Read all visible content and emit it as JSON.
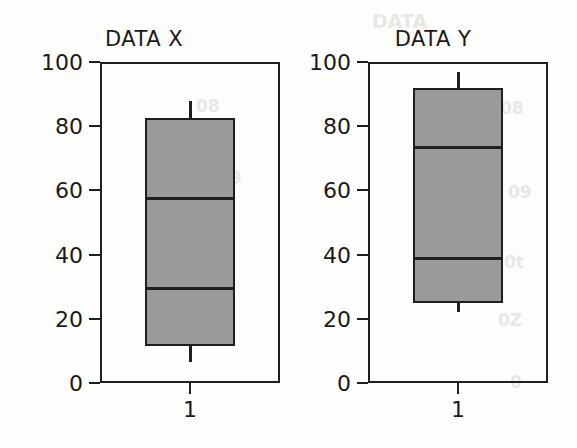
{
  "figure": {
    "background_color": "#fdfdfc",
    "box_fill_color": "#9a9a9a",
    "line_color": "#1f1f1f"
  },
  "artifacts": [
    {
      "text": "DATA",
      "x": 372,
      "y": 10,
      "size": 19
    },
    {
      "text": "08",
      "x": 196,
      "y": 96,
      "size": 17
    },
    {
      "text": "09",
      "x": 218,
      "y": 168,
      "size": 17
    },
    {
      "text": "0t",
      "x": 212,
      "y": 242,
      "size": 17
    },
    {
      "text": "08",
      "x": 500,
      "y": 98,
      "size": 17
    },
    {
      "text": "09",
      "x": 508,
      "y": 182,
      "size": 17
    },
    {
      "text": "0t",
      "x": 504,
      "y": 252,
      "size": 17
    },
    {
      "text": "0Z",
      "x": 498,
      "y": 310,
      "size": 17
    },
    {
      "text": "0",
      "x": 510,
      "y": 372,
      "size": 17
    }
  ],
  "chart_data": {
    "type": "box",
    "title": "",
    "xlabel": "",
    "ylabel": "",
    "ylim": [
      0,
      100
    ],
    "yticks": [
      0,
      20,
      40,
      60,
      80,
      100
    ],
    "ytick_labels": [
      "0",
      "20",
      "40",
      "60",
      "80",
      "100"
    ],
    "xticks": [
      1
    ],
    "xtick_labels": [
      "1"
    ],
    "grid": false,
    "legend": null,
    "panels": [
      {
        "title": "DATA X",
        "category": "1",
        "box": {
          "whisker_high": 88,
          "q3": 82.5,
          "median": 57.5,
          "inner_line": 29.5,
          "q1": 11.5,
          "whisker_low": 6.5
        }
      },
      {
        "title": "DATA Y",
        "category": "1",
        "box": {
          "whisker_high": 97,
          "q3": 92,
          "median": 73.5,
          "inner_line": 39,
          "q1": 25,
          "whisker_low": 22
        }
      }
    ]
  }
}
